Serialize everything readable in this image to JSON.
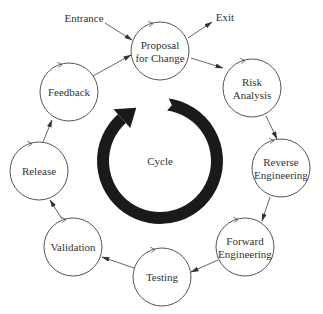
{
  "diagram": {
    "title": "Cycle",
    "colors": {
      "line": "#555555",
      "text": "#333333",
      "ring": "#1a1a1a",
      "background": "#ffffff"
    },
    "center_label": "Cycle",
    "ring": {
      "cx": 160,
      "cy": 161,
      "r": 57,
      "thickness": 12,
      "direction": "clockwise"
    },
    "nodes": [
      {
        "id": "proposal",
        "lines": [
          "Proposal",
          "for Change"
        ],
        "cx": 160,
        "cy": 51,
        "r": 29
      },
      {
        "id": "risk",
        "lines": [
          "Risk",
          "Analysis"
        ],
        "cx": 252,
        "cy": 88,
        "r": 29
      },
      {
        "id": "reverse",
        "lines": [
          "Reverse",
          "Engineering"
        ],
        "cx": 281,
        "cy": 168,
        "r": 29
      },
      {
        "id": "forward",
        "lines": [
          "Forward",
          "Engineering"
        ],
        "cx": 245,
        "cy": 247,
        "r": 29
      },
      {
        "id": "testing",
        "lines": [
          "Testing"
        ],
        "cx": 162,
        "cy": 277,
        "r": 29
      },
      {
        "id": "validation",
        "lines": [
          "Validation"
        ],
        "cx": 73,
        "cy": 247,
        "r": 29
      },
      {
        "id": "release",
        "lines": [
          "Release"
        ],
        "cx": 39,
        "cy": 171,
        "r": 29
      },
      {
        "id": "feedback",
        "lines": [
          "Feedback"
        ],
        "cx": 69,
        "cy": 92,
        "r": 29
      }
    ],
    "external": [
      {
        "id": "entrance",
        "label": "Entrance",
        "x": 84,
        "y": 22,
        "arrow": [
          105,
          23,
          132,
          40
        ]
      },
      {
        "id": "exit",
        "label": "Exit",
        "x": 225,
        "y": 21,
        "arrow": [
          188,
          38,
          212,
          22
        ]
      }
    ],
    "edges": [
      {
        "from": "proposal",
        "to": "risk",
        "line": [
          191,
          58,
          223,
          68
        ]
      },
      {
        "from": "risk",
        "to": "reverse",
        "line": [
          266,
          116,
          277,
          139
        ]
      },
      {
        "from": "reverse",
        "to": "forward",
        "line": [
          270,
          197,
          262,
          221
        ]
      },
      {
        "from": "forward",
        "to": "testing",
        "line": [
          218,
          260,
          191,
          272
        ]
      },
      {
        "from": "testing",
        "to": "validation",
        "line": [
          134,
          268,
          102,
          257
        ]
      },
      {
        "from": "validation",
        "to": "release",
        "line": [
          62,
          219,
          50,
          200
        ]
      },
      {
        "from": "release",
        "to": "feedback",
        "line": [
          43,
          142,
          52,
          120
        ]
      },
      {
        "from": "feedback",
        "to": "proposal",
        "line": [
          93,
          76,
          131,
          55
        ]
      }
    ]
  }
}
